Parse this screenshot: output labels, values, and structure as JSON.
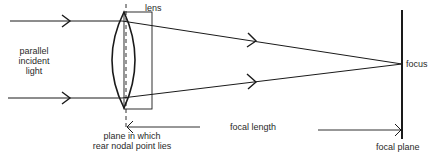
{
  "diagram": {
    "labels": {
      "lens": "lens",
      "incident_line1": "parallel",
      "incident_line2": "incident",
      "incident_line3": "light",
      "focus": "focus",
      "focal_length": "focal length",
      "nodal_line1": "plane in which",
      "nodal_line2": "rear nodal point lies",
      "focal_plane": "focal plane"
    },
    "colors": {
      "stroke": "#1a1a1a",
      "text": "#2a2a2a"
    }
  }
}
